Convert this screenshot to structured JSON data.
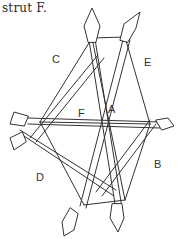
{
  "caption": "strut F.",
  "diagram": {
    "type": "strut-assembly-illustration",
    "labels": {
      "a": "A",
      "b": "B",
      "c": "C",
      "d": "D",
      "e": "E",
      "f": "F"
    },
    "colors": {
      "ink": "#333333",
      "background": "#ffffff"
    }
  }
}
